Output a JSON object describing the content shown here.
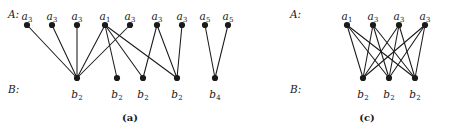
{
  "figure": {
    "background_color": "#ffffff",
    "ink_color": "#1a1a1a",
    "width": 452,
    "height": 134,
    "panels": [
      {
        "id": "panel-a",
        "caption": "(a)",
        "caption_x": 130,
        "caption_y": 113,
        "row_labels": {
          "top": "A:",
          "bottom": "B:"
        },
        "top_label_x": 8,
        "top_label_y": 9,
        "bottom_label_x": 8,
        "bottom_label_y": 84,
        "top_nodes": [
          {
            "label": "a",
            "sub": "3",
            "x": 27,
            "y": 25
          },
          {
            "label": "a",
            "sub": "3",
            "x": 52,
            "y": 25
          },
          {
            "label": "a",
            "sub": "3",
            "x": 77,
            "y": 25
          },
          {
            "label": "a",
            "sub": "1",
            "x": 105,
            "y": 25
          },
          {
            "label": "a",
            "sub": "3",
            "x": 130,
            "y": 25
          },
          {
            "label": "a",
            "sub": "3",
            "x": 157,
            "y": 25
          },
          {
            "label": "a",
            "sub": "3",
            "x": 182,
            "y": 25
          },
          {
            "label": "a",
            "sub": "5",
            "x": 205,
            "y": 25
          },
          {
            "label": "a",
            "sub": "5",
            "x": 228,
            "y": 25
          }
        ],
        "bottom_nodes": [
          {
            "label": "b",
            "sub": "2",
            "x": 77,
            "y": 78
          },
          {
            "label": "b",
            "sub": "2",
            "x": 117,
            "y": 78
          },
          {
            "label": "b",
            "sub": "2",
            "x": 143,
            "y": 78
          },
          {
            "label": "b",
            "sub": "2",
            "x": 177,
            "y": 78
          },
          {
            "label": "b",
            "sub": "4",
            "x": 215,
            "y": 78
          }
        ],
        "edges": [
          [
            0,
            0
          ],
          [
            1,
            0
          ],
          [
            2,
            0
          ],
          [
            3,
            0
          ],
          [
            4,
            0
          ],
          [
            3,
            1
          ],
          [
            3,
            2
          ],
          [
            3,
            3
          ],
          [
            5,
            2
          ],
          [
            5,
            3
          ],
          [
            6,
            3
          ],
          [
            7,
            4
          ],
          [
            8,
            4
          ]
        ]
      },
      {
        "id": "panel-c",
        "caption": "(c)",
        "caption_x": 367,
        "caption_y": 113,
        "row_labels": {
          "top": "A:",
          "bottom": "B:"
        },
        "top_label_x": 290,
        "top_label_y": 9,
        "bottom_label_x": 290,
        "bottom_label_y": 84,
        "top_nodes": [
          {
            "label": "a",
            "sub": "1",
            "x": 347,
            "y": 25
          },
          {
            "label": "a",
            "sub": "3",
            "x": 373,
            "y": 25
          },
          {
            "label": "a",
            "sub": "3",
            "x": 399,
            "y": 25
          },
          {
            "label": "a",
            "sub": "3",
            "x": 425,
            "y": 25
          }
        ],
        "bottom_nodes": [
          {
            "label": "b",
            "sub": "2",
            "x": 363,
            "y": 78
          },
          {
            "label": "b",
            "sub": "2",
            "x": 389,
            "y": 78
          },
          {
            "label": "b",
            "sub": "2",
            "x": 415,
            "y": 78
          }
        ],
        "edges": [
          [
            0,
            0
          ],
          [
            0,
            1
          ],
          [
            0,
            2
          ],
          [
            1,
            0
          ],
          [
            1,
            1
          ],
          [
            1,
            2
          ],
          [
            2,
            0
          ],
          [
            2,
            1
          ],
          [
            2,
            2
          ],
          [
            3,
            0
          ],
          [
            3,
            1
          ],
          [
            3,
            2
          ]
        ]
      }
    ],
    "node_radius": 3.1,
    "vertex_label_offset_top": -9,
    "vertex_label_offset_bottom": 16
  }
}
